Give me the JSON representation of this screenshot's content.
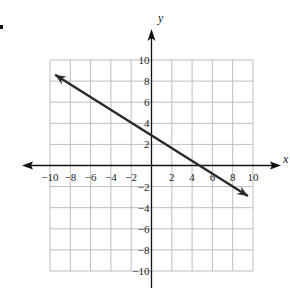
{
  "chart_data": {
    "type": "line",
    "title": "",
    "xlabel": "x",
    "ylabel": "y",
    "xlim": [
      -10,
      10
    ],
    "ylim": [
      -10,
      10
    ],
    "grid": true,
    "grid_step": 2,
    "x_ticks": [
      "-10",
      "-8",
      "-6",
      "-4",
      "-2",
      "2",
      "4",
      "6",
      "8",
      "10"
    ],
    "y_ticks": [
      "10",
      "8",
      "6",
      "4",
      "2",
      "-2",
      "-4",
      "-6",
      "-8",
      "-10"
    ],
    "series": [
      {
        "name": "line",
        "style": "arrow-both-ends",
        "points": [
          [
            -9.5,
            8.6
          ],
          [
            0,
            3.2
          ],
          [
            5.5,
            0
          ],
          [
            9.5,
            -2.9
          ]
        ],
        "slope": -0.6,
        "y_intercept": 3.2,
        "x_intercept": 5.5
      }
    ],
    "colors": {
      "line": "#2a2a2a",
      "grid": "#bdbdbd",
      "axis": "#111111"
    }
  }
}
